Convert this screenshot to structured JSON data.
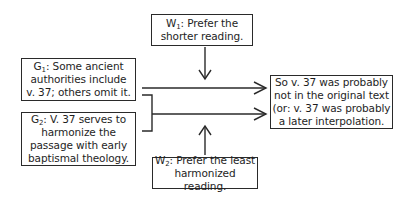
{
  "diagram": {
    "type": "argument-map",
    "nodes": {
      "w1": {
        "label": "W",
        "sub": "1",
        "text": ": Prefer the\nshorter reading."
      },
      "g1": {
        "label": "G",
        "sub": "1",
        "text": ": Some ancient\nauthorities include\nv. 37; others omit it."
      },
      "g2": {
        "label": "G",
        "sub": "2",
        "text": ": V. 37 serves to\nharmonize the\npassage with early\nbaptismal theology."
      },
      "w2": {
        "label": "W",
        "sub": "2",
        "text": ": Prefer the least\nharmonized reading."
      },
      "conclusion": {
        "text": "So v. 37 was probably\nnot in the original text\n(or: v. 37 was probably\na later interpolation."
      }
    },
    "edges": [
      {
        "from": "w1",
        "to": "main-arrow-1",
        "direction": "down"
      },
      {
        "from": "g1",
        "to": "conclusion"
      },
      {
        "from": "g1+g2",
        "to": "conclusion",
        "note": "bracketed joint support"
      },
      {
        "from": "w2",
        "to": "main-arrow-2",
        "direction": "up"
      }
    ],
    "colors": {
      "line": "#2a2a2a",
      "background": "#ffffff"
    }
  }
}
